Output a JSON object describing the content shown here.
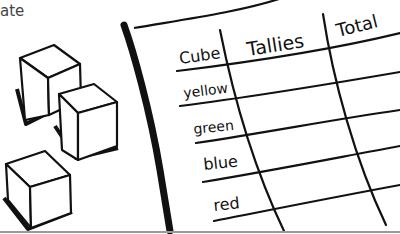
{
  "caption_fragment": "ate",
  "table": {
    "headers": [
      "Cube",
      "Tallies",
      "Total"
    ],
    "rows": [
      {
        "cube": "yellow",
        "tallies": "",
        "total": ""
      },
      {
        "cube": "green",
        "tallies": "",
        "total": ""
      },
      {
        "cube": "blue",
        "tallies": "",
        "total": ""
      },
      {
        "cube": "red",
        "tallies": "",
        "total": ""
      }
    ]
  },
  "illustration": {
    "cubes_count": 3,
    "line_color": "#111111",
    "paper_color": "#ffffff",
    "bottom_rule_color": "#9a9a9a"
  }
}
